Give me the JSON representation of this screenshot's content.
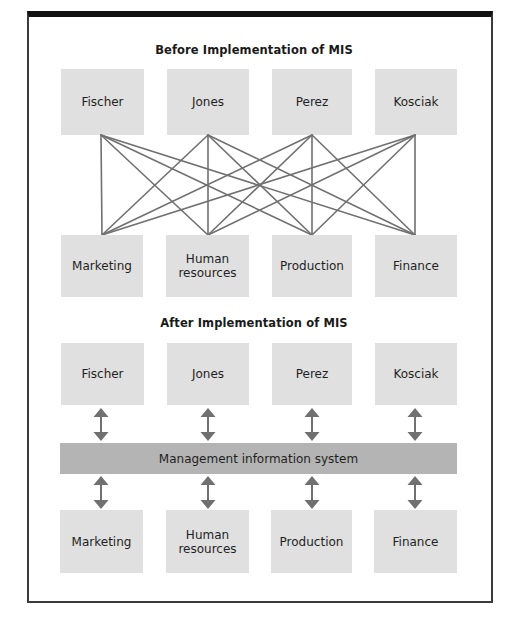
{
  "before": {
    "title": "Before Implementation of MIS",
    "people": [
      {
        "label": "Fischer"
      },
      {
        "label": "Jones"
      },
      {
        "label": "Perez"
      },
      {
        "label": "Kosciak"
      }
    ],
    "departments": [
      {
        "label": "Marketing"
      },
      {
        "label": "Human resources"
      },
      {
        "label": "Production"
      },
      {
        "label": "Finance"
      }
    ],
    "connections": "every person connected directly to every department (16 lines)"
  },
  "after": {
    "title": "After Implementation of MIS",
    "people": [
      {
        "label": "Fischer"
      },
      {
        "label": "Jones"
      },
      {
        "label": "Perez"
      },
      {
        "label": "Kosciak"
      }
    ],
    "system": {
      "label": "Management information system"
    },
    "departments": [
      {
        "label": "Marketing"
      },
      {
        "label": "Human resources"
      },
      {
        "label": "Production"
      },
      {
        "label": "Finance"
      }
    ],
    "connections": "each person and each department linked by two-way arrow to the MIS"
  },
  "colors": {
    "box": "#e0e0e0",
    "system_bar": "#b4b4b4",
    "connector": "#707070",
    "frame": "#111111"
  }
}
